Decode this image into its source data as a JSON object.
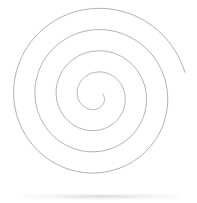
{
  "canvas": {
    "width": 197,
    "height": 203,
    "background_color": "#ffffff",
    "description": "Line drawing of a single spiral on a plain white background"
  },
  "artwork": {
    "name": "spiral",
    "shape_type": "archimedean-spiral",
    "stroke_color": "#9a9a9a",
    "stroke_width": 0.8,
    "fill": "none",
    "turns": 4,
    "winding_direction": "clockwise-outward",
    "center": {
      "x": 96,
      "y": 96
    },
    "inner_radius": 7,
    "outer_radius": 92,
    "start_angle_deg": -15,
    "inner_endpoint": {
      "x": 103,
      "y": 93
    },
    "outer_endpoint": {
      "x": 188,
      "y": 90
    },
    "bounds": {
      "left": 11,
      "top": 13,
      "right": 189,
      "bottom": 182
    },
    "points_per_turn": 180
  },
  "artifacts": {
    "bottom_smudge": {
      "name": "bottom-edge-smudge",
      "color": "#8c8c8c",
      "opacity": 0.3,
      "visible": true
    }
  }
}
